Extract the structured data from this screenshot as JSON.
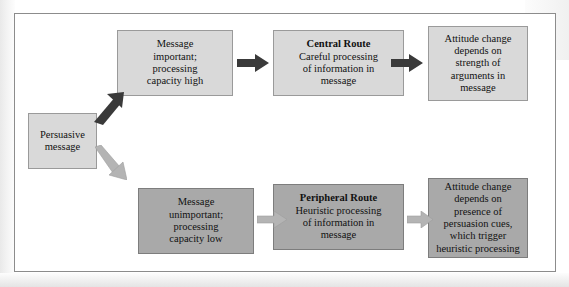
{
  "diagram": {
    "colors": {
      "node_light_fill": "#d9d9d9",
      "node_light_border": "#9a9a9a",
      "node_dark_fill": "#a9a9a9",
      "node_dark_border": "#7d7d7d",
      "arrow_dark": "#3a3a3a",
      "arrow_light": "#b4b4b4",
      "frame_border": "#8c8c8c",
      "background": "#ffffff"
    },
    "nodes": {
      "source": {
        "text": "Persuasive\nmessage",
        "lines": [
          "Persuasive",
          "message"
        ]
      },
      "top_1": {
        "lines": [
          "Message",
          "important;",
          "processing",
          "capacity high"
        ]
      },
      "top_2": {
        "route_label": "Central Route",
        "lines": [
          "Careful processing",
          "of information in",
          "message"
        ]
      },
      "top_3": {
        "lines": [
          "Attitude change",
          "depends on",
          "strength of",
          "arguments in",
          "message"
        ]
      },
      "bottom_1": {
        "lines": [
          "Message",
          "unimportant;",
          "processing",
          "capacity low"
        ]
      },
      "bottom_2": {
        "route_label": "Peripheral Route",
        "lines": [
          "Heuristic processing",
          "of information in",
          "message"
        ]
      },
      "bottom_3": {
        "lines": [
          "Attitude change",
          "depends on",
          "presence of",
          "persuasion cues,",
          "which trigger",
          "heuristic processing"
        ]
      }
    },
    "arrows": [
      {
        "name": "source-to-top-1",
        "style": "dark",
        "direction": "up-right"
      },
      {
        "name": "source-to-bottom-1",
        "style": "light",
        "direction": "down-right"
      },
      {
        "name": "top-1-to-top-2",
        "style": "dark",
        "direction": "right"
      },
      {
        "name": "top-2-to-top-3",
        "style": "dark",
        "direction": "right"
      },
      {
        "name": "bottom-1-to-bottom-2",
        "style": "light",
        "direction": "right"
      },
      {
        "name": "bottom-2-to-bottom-3",
        "style": "light",
        "direction": "right"
      }
    ]
  }
}
